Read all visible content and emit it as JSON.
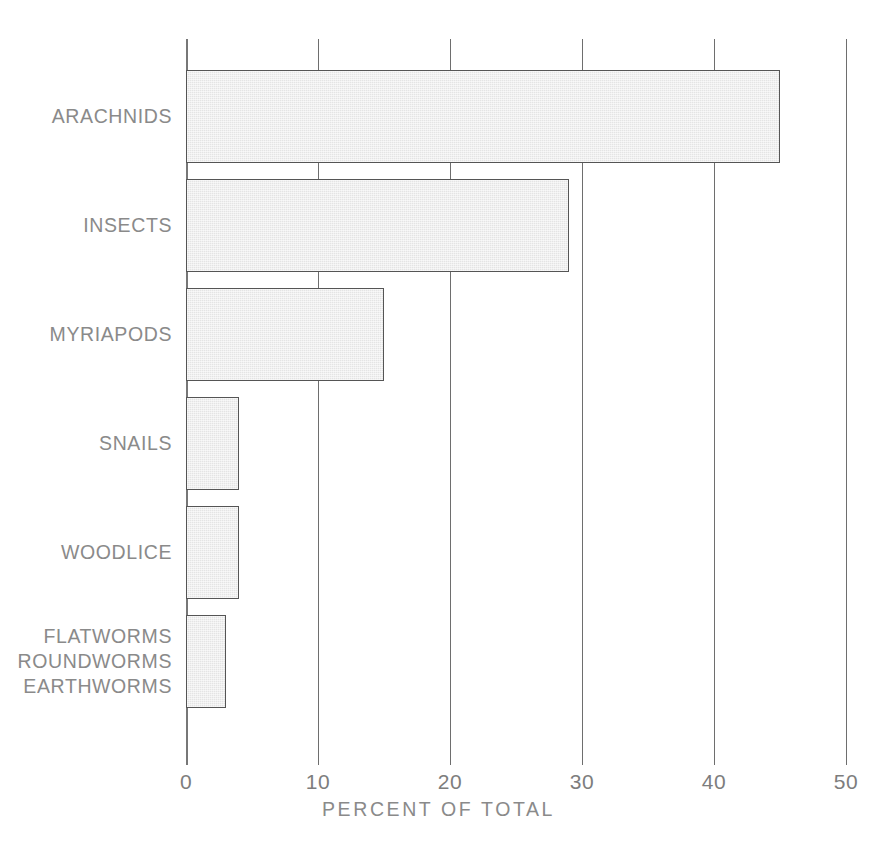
{
  "chart_data": {
    "type": "bar",
    "orientation": "horizontal",
    "title": "",
    "xlabel": "PERCENT OF TOTAL",
    "ylabel": "",
    "xlim": [
      0,
      50
    ],
    "xticks": [
      0,
      10,
      20,
      30,
      40,
      50
    ],
    "xtick_labels": [
      "0",
      "10",
      "20",
      "30",
      "40",
      "50"
    ],
    "grid": true,
    "grid_axis": "x",
    "legend": false,
    "categories": [
      "ARACHNIDS",
      "INSECTS",
      "MYRIAPODS",
      "SNAILS",
      "WOODLICE",
      "FLATWORMS ROUNDWORMS EARTHWORMS"
    ],
    "category_label_lines": [
      [
        "ARACHNIDS"
      ],
      [
        "INSECTS"
      ],
      [
        "MYRIAPODS"
      ],
      [
        "SNAILS"
      ],
      [
        "WOODLICE"
      ],
      [
        "FLATWORMS",
        "ROUNDWORMS",
        "EARTHWORMS"
      ]
    ],
    "values": [
      45,
      29,
      15,
      4,
      4,
      3
    ],
    "bar_fill_color": "#e4e4e4",
    "bar_edge_color": "#555555",
    "axis_color": "#6e6e6e",
    "text_color": "#8a8a8a"
  },
  "axis": {
    "x_title": "PERCENT OF TOTAL",
    "ticks": [
      {
        "value": 0,
        "label": "0"
      },
      {
        "value": 10,
        "label": "10"
      },
      {
        "value": 20,
        "label": "20"
      },
      {
        "value": 30,
        "label": "30"
      },
      {
        "value": 40,
        "label": "40"
      },
      {
        "value": 50,
        "label": "50"
      }
    ]
  },
  "bars": [
    {
      "label": "ARACHNIDS",
      "lines": [
        "ARACHNIDS"
      ],
      "value": 45
    },
    {
      "label": "INSECTS",
      "lines": [
        "INSECTS"
      ],
      "value": 29
    },
    {
      "label": "MYRIAPODS",
      "lines": [
        "MYRIAPODS"
      ],
      "value": 15
    },
    {
      "label": "SNAILS",
      "lines": [
        "SNAILS"
      ],
      "value": 4
    },
    {
      "label": "WOODLICE",
      "lines": [
        "WOODLICE"
      ],
      "value": 4
    },
    {
      "label": "WORMS",
      "lines": [
        "FLATWORMS",
        "ROUNDWORMS",
        "EARTHWORMS"
      ],
      "value": 3
    }
  ]
}
